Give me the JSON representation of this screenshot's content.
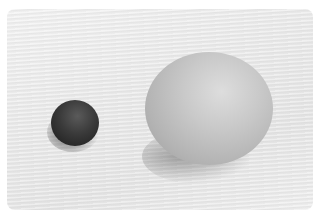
{
  "image": {
    "description": "Grayscale photo of a small dark round ball next to a larger light-colored egg on a textured white surface",
    "objects": [
      {
        "name": "dark-ball",
        "color": "#2e2e2e"
      },
      {
        "name": "egg",
        "color": "#c4c4c4"
      }
    ],
    "background_color": "#ffffff",
    "surface_color": "#ebebeb"
  }
}
